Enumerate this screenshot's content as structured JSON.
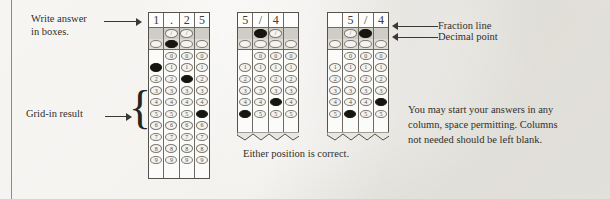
{
  "page": {
    "background_color": "#e9e7e1",
    "ink_color": "#2b2a28"
  },
  "labels": {
    "write_answer": "Write answer\nin boxes.",
    "grid_in_result": "Grid-in result",
    "fraction_line": "Fraction line",
    "decimal_point": "Decimal point",
    "either_position": "Either position is correct.",
    "note": "You may start your answers in any\ncolumn, space permitting. Columns\nnot needed should be left blank."
  },
  "glyphs": {
    "slash": "/",
    "decimal": ".",
    "brace": "{"
  },
  "grids": [
    {
      "id": "grid-decimal-125",
      "written": [
        "1",
        ".",
        "2",
        "5"
      ],
      "fraction_row": [
        null,
        "/",
        "/",
        null
      ],
      "fraction_filled": [
        false,
        false,
        false,
        false
      ],
      "decimal_row": [
        ".",
        ".",
        ".",
        "."
      ],
      "decimal_filled": [
        false,
        true,
        false,
        false
      ],
      "digits": [
        "0",
        "1",
        "2",
        "3",
        "4",
        "5",
        "6",
        "7",
        "8",
        "9"
      ],
      "zero_blank_columns": [
        0
      ],
      "filled": {
        "0": "1",
        "1": null,
        "2": "2",
        "3": "5"
      },
      "truncated": false
    },
    {
      "id": "grid-fraction-54-left",
      "written": [
        "5",
        "/",
        "4",
        ""
      ],
      "fraction_row": [
        null,
        "/",
        "/",
        null
      ],
      "fraction_filled": [
        false,
        true,
        false,
        false
      ],
      "decimal_row": [
        ".",
        ".",
        ".",
        "."
      ],
      "decimal_filled": [
        false,
        false,
        false,
        false
      ],
      "digits": [
        "0",
        "1",
        "2",
        "3",
        "4",
        "5"
      ],
      "zero_blank_columns": [
        0
      ],
      "filled": {
        "0": "5",
        "1": null,
        "2": "4",
        "3": null
      },
      "truncated": true
    },
    {
      "id": "grid-fraction-54-right",
      "written": [
        "",
        "5",
        "/",
        "4"
      ],
      "fraction_row": [
        null,
        "/",
        "/",
        null
      ],
      "fraction_filled": [
        false,
        false,
        true,
        false
      ],
      "decimal_row": [
        ".",
        ".",
        ".",
        "."
      ],
      "decimal_filled": [
        false,
        false,
        false,
        false
      ],
      "digits": [
        "0",
        "1",
        "2",
        "3",
        "4",
        "5"
      ],
      "zero_blank_columns": [
        0
      ],
      "filled": {
        "0": null,
        "1": "5",
        "2": null,
        "3": "4"
      },
      "truncated": true
    }
  ]
}
